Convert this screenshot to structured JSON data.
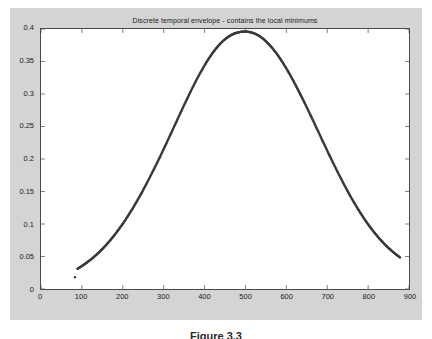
{
  "figure": {
    "background_color": "#d4d4d4",
    "axes_background_color": "#ffffff",
    "axes_edge_color": "#4a4a4a",
    "marker_color": "#3a3a3a"
  },
  "caption": "Figure 3.3",
  "chart_data": {
    "type": "scatter",
    "title": "Discrete temporal envelope - contains the local minimums",
    "xlabel": "",
    "ylabel": "",
    "xlim": [
      0,
      900
    ],
    "ylim": [
      0,
      0.4
    ],
    "grid": false,
    "legend": null,
    "marker": "dot",
    "marker_size": 1.2,
    "xticks": [
      0,
      100,
      200,
      300,
      400,
      500,
      600,
      700,
      800,
      900
    ],
    "xtick_labels": [
      "0",
      "100",
      "200",
      "300",
      "400",
      "500",
      "600",
      "700",
      "800",
      "900"
    ],
    "yticks": [
      0,
      0.05,
      0.1,
      0.15,
      0.2,
      0.25,
      0.3,
      0.35,
      0.4
    ],
    "ytick_labels": [
      "0",
      "0.05",
      "0.1",
      "0.15",
      "0.2",
      "0.25",
      "0.3",
      "0.35",
      "0.4"
    ],
    "annotations": [
      {
        "text": "isolated low start point",
        "x": 83,
        "y": 0.018
      }
    ],
    "x": [
      83,
      88,
      93,
      98,
      103,
      108,
      113,
      118,
      123,
      128,
      133,
      138,
      143,
      148,
      153,
      158,
      163,
      168,
      173,
      178,
      183,
      188,
      193,
      198,
      203,
      208,
      213,
      218,
      223,
      228,
      233,
      238,
      243,
      248,
      253,
      258,
      263,
      268,
      273,
      278,
      283,
      288,
      293,
      298,
      303,
      308,
      313,
      318,
      323,
      328,
      333,
      338,
      343,
      348,
      353,
      358,
      363,
      368,
      373,
      378,
      383,
      388,
      393,
      398,
      403,
      408,
      413,
      418,
      423,
      428,
      433,
      438,
      443,
      448,
      453,
      458,
      463,
      468,
      473,
      478,
      483,
      488,
      493,
      498,
      503,
      508,
      513,
      518,
      523,
      528,
      533,
      538,
      543,
      548,
      553,
      558,
      563,
      568,
      573,
      578,
      583,
      588,
      593,
      598,
      603,
      608,
      613,
      618,
      623,
      628,
      633,
      638,
      643,
      648,
      653,
      658,
      663,
      668,
      673,
      678,
      683,
      688,
      693,
      698,
      703,
      708,
      713,
      718,
      723,
      728,
      733,
      738,
      743,
      748,
      753,
      758,
      763,
      768,
      773,
      778,
      783,
      788,
      793,
      798,
      803,
      808,
      813,
      818,
      823,
      828,
      833,
      838,
      843,
      848,
      853,
      858,
      863,
      868,
      873,
      878
    ],
    "y": [
      0.018,
      0.0305,
      0.0325,
      0.0345,
      0.0366,
      0.0388,
      0.0411,
      0.0435,
      0.046,
      0.0486,
      0.0513,
      0.0542,
      0.0572,
      0.0603,
      0.0635,
      0.0669,
      0.0704,
      0.074,
      0.0778,
      0.0817,
      0.0857,
      0.0899,
      0.0942,
      0.0986,
      0.1032,
      0.1079,
      0.1127,
      0.1177,
      0.1228,
      0.128,
      0.1334,
      0.1388,
      0.1444,
      0.1501,
      0.156,
      0.1619,
      0.1679,
      0.1741,
      0.1803,
      0.1866,
      0.193,
      0.1995,
      0.206,
      0.2126,
      0.2193,
      0.226,
      0.2327,
      0.2395,
      0.2463,
      0.2531,
      0.2599,
      0.2667,
      0.2735,
      0.2802,
      0.2869,
      0.2935,
      0.3,
      0.3064,
      0.3127,
      0.3189,
      0.3249,
      0.3308,
      0.3364,
      0.3419,
      0.3472,
      0.3522,
      0.357,
      0.3616,
      0.3659,
      0.3699,
      0.3737,
      0.3771,
      0.3803,
      0.3832,
      0.3858,
      0.388,
      0.39,
      0.3917,
      0.393,
      0.3941,
      0.3949,
      0.3955,
      0.3959,
      0.396,
      0.3959,
      0.3955,
      0.3949,
      0.394,
      0.3929,
      0.3914,
      0.3896,
      0.3875,
      0.3851,
      0.3824,
      0.3794,
      0.3762,
      0.3727,
      0.3689,
      0.3649,
      0.3607,
      0.3562,
      0.3515,
      0.3466,
      0.3415,
      0.3362,
      0.3307,
      0.3251,
      0.3193,
      0.3134,
      0.3073,
      0.3012,
      0.2949,
      0.2885,
      0.2821,
      0.2756,
      0.269,
      0.2624,
      0.2557,
      0.249,
      0.2423,
      0.2356,
      0.2289,
      0.2222,
      0.2156,
      0.209,
      0.2024,
      0.1959,
      0.1895,
      0.1831,
      0.1768,
      0.1707,
      0.1646,
      0.1586,
      0.1528,
      0.147,
      0.1414,
      0.1359,
      0.1306,
      0.1253,
      0.1203,
      0.1153,
      0.1105,
      0.1059,
      0.1013,
      0.097,
      0.0928,
      0.0887,
      0.0848,
      0.081,
      0.0774,
      0.0739,
      0.0706,
      0.0674,
      0.0643,
      0.0614,
      0.0586,
      0.0559,
      0.0533,
      0.0509,
      0.0485,
      0.0463,
      0.0441,
      0.0256
    ]
  }
}
